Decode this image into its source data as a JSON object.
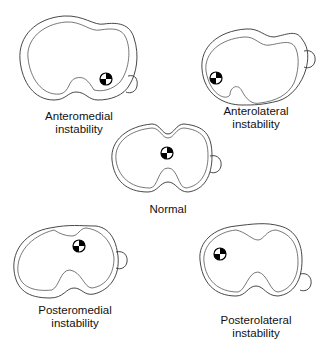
{
  "figure": {
    "panels": [
      {
        "id": "anteromedial",
        "caption_line1": "Anteromedial",
        "caption_line2": "instability"
      },
      {
        "id": "anterolateral",
        "caption_line1": "Anterolateral",
        "caption_line2": "instability"
      },
      {
        "id": "normal",
        "caption_line1": "Normal",
        "caption_line2": ""
      },
      {
        "id": "posteromedial",
        "caption_line1": "Posteromedial",
        "caption_line2": "instability"
      },
      {
        "id": "posterolateral",
        "caption_line1": "Posterolateral",
        "caption_line2": "instability"
      }
    ],
    "symbol": "center-of-rotation-marker",
    "colors": {
      "line": "#333333",
      "marker": "#000000",
      "background": "#ffffff"
    }
  }
}
